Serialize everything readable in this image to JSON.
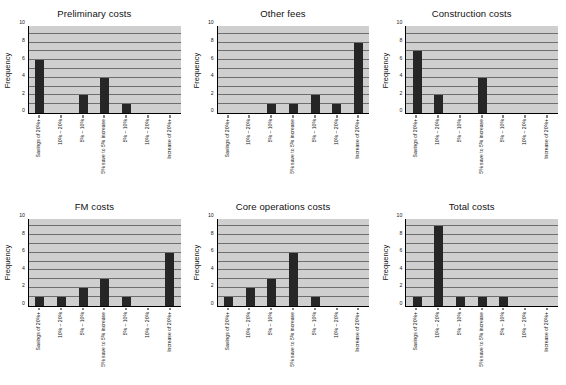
{
  "figure": {
    "categories": [
      "Savings of 20%+",
      "10% – 20%",
      "5% – 10%",
      "5% save to 5% increase",
      "5% – 10%",
      "10% – 20%",
      "Increase of 20%+"
    ],
    "y_axis_label": "Frequency",
    "y_ticks": [
      "0",
      "2",
      "4",
      "6",
      "8",
      "10"
    ],
    "y_limit": 10,
    "gridline_count": 10,
    "colors": {
      "plot_background": "#cfcfcf",
      "gridline": "#6e6e6e",
      "bar": "#262626",
      "axis": "#000000",
      "page_background": "#ffffff"
    }
  },
  "chart_data": [
    {
      "type": "bar",
      "title": "Preliminary costs",
      "categories": [
        "Savings of 20%+",
        "10% – 20%",
        "5% – 10%",
        "5% save to 5% increase",
        "5% – 10%",
        "10% – 20%",
        "Increase of 20%+"
      ],
      "values": [
        6,
        0,
        2,
        4,
        1,
        0,
        0
      ],
      "xlabel": "",
      "ylabel": "Frequency",
      "ylim": [
        0,
        10
      ],
      "yticks": [
        0,
        2,
        4,
        6,
        8,
        10
      ],
      "grid": true,
      "legend": false
    },
    {
      "type": "bar",
      "title": "Other fees",
      "categories": [
        "Savings of 20%+",
        "10% – 20%",
        "5% – 10%",
        "5% save to 5% increase",
        "5% – 10%",
        "10% – 20%",
        "Increase of 20%+"
      ],
      "values": [
        0,
        0,
        1,
        1,
        2,
        1,
        8
      ],
      "xlabel": "",
      "ylabel": "Frequency",
      "ylim": [
        0,
        10
      ],
      "yticks": [
        0,
        2,
        4,
        6,
        8,
        10
      ],
      "grid": true,
      "legend": false
    },
    {
      "type": "bar",
      "title": "Construction costs",
      "categories": [
        "Savings of 20%+",
        "10% – 20%",
        "5% – 10%",
        "5% save to 5% increase",
        "5% – 10%",
        "10% – 20%",
        "Increase of 20%+"
      ],
      "values": [
        7,
        2,
        0,
        4,
        0,
        0,
        0
      ],
      "xlabel": "",
      "ylabel": "Frequency",
      "ylim": [
        0,
        10
      ],
      "yticks": [
        0,
        2,
        4,
        6,
        8,
        10
      ],
      "grid": true,
      "legend": false
    },
    {
      "type": "bar",
      "title": "FM costs",
      "categories": [
        "Savings of 20%+",
        "10% – 20%",
        "5% – 10%",
        "5% save to 5% increase",
        "5% – 10%",
        "10% – 20%",
        "Increase of 20%+"
      ],
      "values": [
        1,
        1,
        2,
        3,
        1,
        0,
        6
      ],
      "xlabel": "",
      "ylabel": "Frequency",
      "ylim": [
        0,
        10
      ],
      "yticks": [
        0,
        2,
        4,
        6,
        8,
        10
      ],
      "grid": true,
      "legend": false
    },
    {
      "type": "bar",
      "title": "Core operations costs",
      "categories": [
        "Savings of 20%+",
        "10% – 20%",
        "5% – 10%",
        "5% save to 5% increase",
        "5% – 10%",
        "10% – 20%",
        "Increase of 20%+"
      ],
      "values": [
        1,
        2,
        3,
        6,
        1,
        0,
        0
      ],
      "xlabel": "",
      "ylabel": "Frequency",
      "ylim": [
        0,
        10
      ],
      "yticks": [
        0,
        2,
        4,
        6,
        8,
        10
      ],
      "grid": true,
      "legend": false
    },
    {
      "type": "bar",
      "title": "Total costs",
      "categories": [
        "Savings of 20%+",
        "10% – 20%",
        "5% – 10%",
        "5% save to 5% increase",
        "5% – 10%",
        "10% – 20%",
        "Increase of 20%+"
      ],
      "values": [
        1,
        9,
        1,
        1,
        1,
        0,
        0
      ],
      "xlabel": "",
      "ylabel": "Frequency",
      "ylim": [
        0,
        10
      ],
      "yticks": [
        0,
        2,
        4,
        6,
        8,
        10
      ],
      "grid": true,
      "legend": false
    }
  ]
}
